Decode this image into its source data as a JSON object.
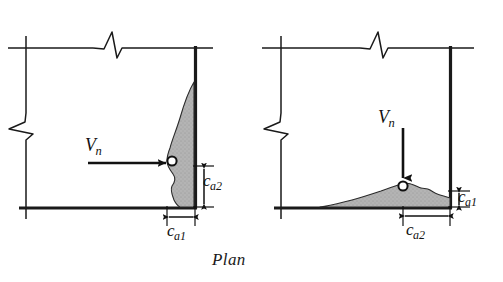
{
  "figure": {
    "caption": "Plan",
    "width": 503,
    "height": 282,
    "background_color": "#ffffff",
    "line_color": "#1a1a1a",
    "shade_fill": "#b0b0b0",
    "shade_stroke": "#2a2a2a"
  },
  "diagrams": [
    {
      "id": "left",
      "name": "shear-perpendicular-to-edge",
      "load": {
        "symbol": "V",
        "subscript": "n",
        "direction": "horizontal-right"
      },
      "anchor": {
        "marker": "circle"
      },
      "breakout": {
        "shape": "teardrop-vertical",
        "orientation": "against-right-edge"
      },
      "dimensions": [
        {
          "symbol": "c",
          "subscript": "a1",
          "orientation": "horizontal",
          "position": "below-breakout-width"
        },
        {
          "symbol": "c",
          "subscript": "a2",
          "orientation": "vertical",
          "position": "right-of-edge"
        }
      ]
    },
    {
      "id": "right",
      "name": "shear-parallel-to-edge",
      "load": {
        "symbol": "V",
        "subscript": "n",
        "direction": "vertical-down"
      },
      "anchor": {
        "marker": "circle"
      },
      "breakout": {
        "shape": "mound-horizontal",
        "orientation": "along-bottom-edge"
      },
      "dimensions": [
        {
          "symbol": "c",
          "subscript": "a1",
          "orientation": "vertical",
          "position": "right-of-edge"
        },
        {
          "symbol": "c",
          "subscript": "a2",
          "orientation": "horizontal",
          "position": "below-breakout-width"
        }
      ]
    }
  ],
  "labels": {
    "vn_symbol": "V",
    "vn_subscript": "n",
    "c_symbol": "c",
    "ca1_subscript": "a1",
    "ca2_subscript": "a2"
  }
}
